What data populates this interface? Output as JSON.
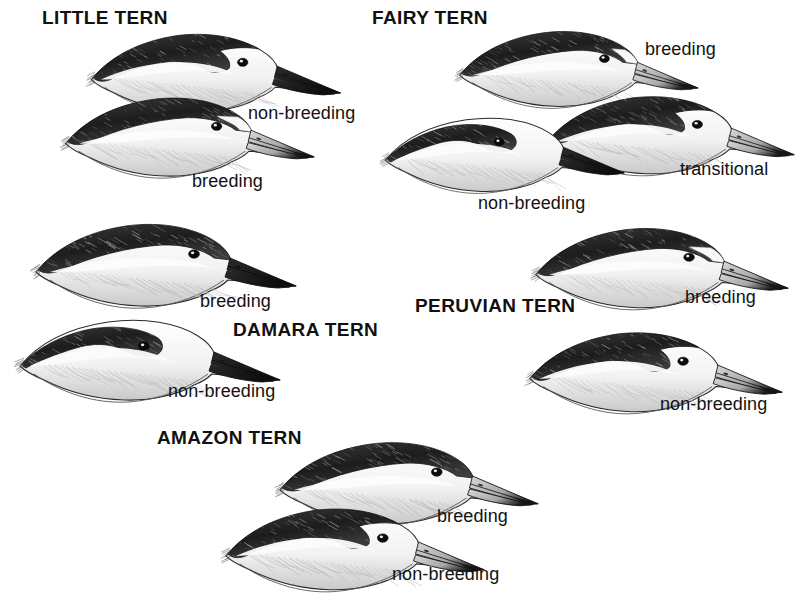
{
  "plate": {
    "kind": "field-guide-illustration-plate",
    "subject": "tern head profiles",
    "background_color": "#ffffff",
    "ink_color": "#111111",
    "width": 795,
    "height": 597
  },
  "species": [
    {
      "id": "little-tern",
      "title": "LITTLE TERN",
      "title_x": 42,
      "title_y": 8,
      "figures": [
        {
          "id": "little-tern-non-breeding",
          "plumage": "non-breeding",
          "label_x": 248,
          "label_y": 104,
          "head_x": 78,
          "head_y": 24,
          "head_w": 270,
          "head_h": 92,
          "crown": "partial",
          "forehead": "white",
          "bill": "dark",
          "scale": 1.0,
          "flip": false
        },
        {
          "id": "little-tern-breeding",
          "plumage": "breeding",
          "label_x": 192,
          "label_y": 172,
          "head_x": 58,
          "head_y": 88,
          "head_w": 258,
          "head_h": 92,
          "crown": "full",
          "forehead": "white-wedge",
          "bill": "pale",
          "scale": 1.0,
          "flip": false
        }
      ]
    },
    {
      "id": "fairy-tern",
      "title": "FAIRY TERN",
      "title_x": 372,
      "title_y": 8,
      "figures": [
        {
          "id": "fairy-tern-breeding",
          "plumage": "breeding",
          "label_x": 645,
          "label_y": 40,
          "head_x": 452,
          "head_y": 22,
          "head_w": 248,
          "head_h": 88,
          "crown": "full",
          "forehead": "white-small",
          "bill": "pale",
          "scale": 1.0,
          "flip": false
        },
        {
          "id": "fairy-tern-transitional",
          "plumage": "transitional",
          "label_x": 680,
          "label_y": 160,
          "head_x": 540,
          "head_y": 86,
          "head_w": 256,
          "head_h": 92,
          "crown": "partial",
          "forehead": "white",
          "bill": "pale",
          "scale": 1.0,
          "flip": false
        },
        {
          "id": "fairy-tern-non-breeding",
          "plumage": "non-breeding",
          "label_x": 478,
          "label_y": 194,
          "head_x": 378,
          "head_y": 105,
          "head_w": 248,
          "head_h": 92,
          "crown": "stripe",
          "forehead": "white",
          "bill": "dark",
          "scale": 1.0,
          "flip": false
        }
      ]
    },
    {
      "id": "damara-tern",
      "title": "DAMARA TERN",
      "title_x": 233,
      "title_y": 320,
      "figures": [
        {
          "id": "damara-tern-breeding",
          "plumage": "breeding",
          "label_x": 200,
          "label_y": 292,
          "head_x": 28,
          "head_y": 214,
          "head_w": 270,
          "head_h": 96,
          "crown": "full",
          "forehead": "dark",
          "bill": "dark",
          "scale": 1.0,
          "flip": false
        },
        {
          "id": "damara-tern-non-breeding",
          "plumage": "non-breeding",
          "label_x": 168,
          "label_y": 382,
          "head_x": 12,
          "head_y": 308,
          "head_w": 270,
          "head_h": 96,
          "crown": "stripe",
          "forehead": "white",
          "bill": "dark",
          "scale": 1.0,
          "flip": false
        }
      ]
    },
    {
      "id": "peruvian-tern",
      "title": "PERUVIAN TERN",
      "title_x": 415,
      "title_y": 296,
      "figures": [
        {
          "id": "peruvian-tern-breeding",
          "plumage": "breeding",
          "label_x": 685,
          "label_y": 288,
          "head_x": 528,
          "head_y": 218,
          "head_w": 262,
          "head_h": 94,
          "crown": "full",
          "forehead": "white-wedge",
          "bill": "pale",
          "scale": 1.0,
          "flip": false
        },
        {
          "id": "peruvian-tern-non-breeding",
          "plumage": "non-breeding",
          "label_x": 660,
          "label_y": 395,
          "head_x": 522,
          "head_y": 320,
          "head_w": 262,
          "head_h": 98,
          "crown": "partial",
          "forehead": "white",
          "bill": "pale",
          "scale": 1.0,
          "flip": false
        }
      ]
    },
    {
      "id": "amazon-tern",
      "title": "AMAZON TERN",
      "title_x": 157,
      "title_y": 428,
      "figures": [
        {
          "id": "amazon-tern-breeding",
          "plumage": "breeding",
          "label_x": 437,
          "label_y": 507,
          "head_x": 272,
          "head_y": 432,
          "head_w": 268,
          "head_h": 96,
          "crown": "full",
          "forehead": "dark",
          "bill": "pale",
          "scale": 1.0,
          "flip": false
        },
        {
          "id": "amazon-tern-non-breeding",
          "plumage": "non-breeding",
          "label_x": 392,
          "label_y": 565,
          "head_x": 218,
          "head_y": 498,
          "head_w": 268,
          "head_h": 96,
          "crown": "partial",
          "forehead": "white",
          "bill": "pale",
          "scale": 1.0,
          "flip": false
        }
      ]
    }
  ]
}
